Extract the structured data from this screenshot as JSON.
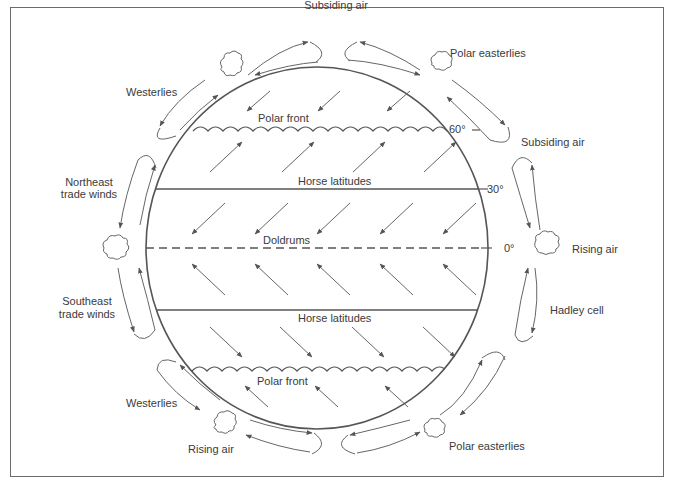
{
  "diagram": {
    "colors": {
      "line": "#555555",
      "text": "#3a3a3a",
      "frame": "#6b6b6b",
      "background": "#ffffff"
    },
    "labels": {
      "subsiding_air_top": "Subsiding air",
      "polar_easterlies_top": "Polar easterlies",
      "westerlies_top": "Westerlies",
      "polar_front_top": "Polar front",
      "lat_60": "60°",
      "subsiding_air_right": "Subsiding air",
      "northeast_trade_winds_1": "Northeast",
      "northeast_trade_winds_2": "trade winds",
      "horse_latitudes_north": "Horse latitudes",
      "lat_30": "30°",
      "doldrums": "Doldrums",
      "lat_0": "0°",
      "rising_air_right": "Rising air",
      "southeast_trade_winds_1": "Southeast",
      "southeast_trade_winds_2": "trade winds",
      "hadley_cell": "Hadley cell",
      "horse_latitudes_south": "Horse latitudes",
      "polar_front_bottom": "Polar front",
      "westerlies_bottom": "Westerlies",
      "rising_air_bottom": "Rising air",
      "polar_easterlies_bottom": "Polar easterlies"
    },
    "latitude_lines": [
      {
        "name": "60N polar front",
        "style": "wavy",
        "y": 128
      },
      {
        "name": "30N horse latitudes",
        "style": "solid",
        "y": 189
      },
      {
        "name": "0 equator doldrums",
        "style": "dashed",
        "y": 248
      },
      {
        "name": "30S horse latitudes",
        "style": "solid",
        "y": 310
      },
      {
        "name": "60S polar front",
        "style": "wavy",
        "y": 369
      }
    ],
    "wind_bands": [
      {
        "band": "60N-90N",
        "direction": "southwest",
        "count": 3
      },
      {
        "band": "30N-60N",
        "direction": "northeast",
        "count": 4
      },
      {
        "band": "0-30N",
        "direction": "southwest",
        "count": 5
      },
      {
        "band": "0-30S",
        "direction": "northwest",
        "count": 5
      },
      {
        "band": "30S-60S",
        "direction": "southeast",
        "count": 4
      },
      {
        "band": "60S-90S",
        "direction": "northwest",
        "count": 3
      }
    ]
  }
}
